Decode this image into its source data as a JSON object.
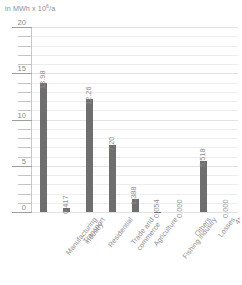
{
  "chart_data": {
    "type": "bar",
    "title": "",
    "subtitle": "",
    "unit_caption": "in MWh x 10",
    "unit_exponent": "6",
    "unit_suffix": "/a",
    "ylabel": "in MWh x 10^6/a",
    "xlabel": "",
    "ylim": [
      0,
      20
    ],
    "ytick_labels": [
      "0",
      "5",
      "10",
      "15",
      "20"
    ],
    "ytick_values": [
      0,
      5,
      10,
      15,
      20
    ],
    "minor_tick_step": 1,
    "grid": true,
    "legend": "none",
    "bar_color": "#6e6e6e",
    "grid_color": "#ededed",
    "axis_color": "#c4c4c4",
    "text_color": "#8e8e8e",
    "categories": [
      "Manufacturing industry",
      "Transport",
      "Residential",
      "Trade and commerce",
      "Agriculture",
      "Fishing industry",
      "Others",
      "Losses",
      "4*"
    ],
    "category_lines": [
      [
        "Manufacturing",
        "industry"
      ],
      [
        "Transport"
      ],
      [
        "Residential"
      ],
      [
        "Trade and",
        "commerce"
      ],
      [
        "Agriculture"
      ],
      [
        "Fishing industry"
      ],
      [
        "Others"
      ],
      [
        "Losses"
      ],
      [
        "4*"
      ]
    ],
    "values": [
      13.98,
      0.417,
      12.26,
      7.2,
      1.388,
      0.054,
      0.0,
      5.518,
      0.0
    ],
    "value_labels": [
      "13.98",
      "0.417",
      "12.26",
      "7.20",
      "1.388",
      "0.054",
      "0.000",
      "5.518",
      "0.000"
    ]
  }
}
